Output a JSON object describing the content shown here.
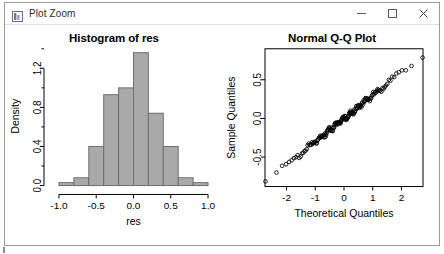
{
  "window": {
    "title": "Plot Zoom",
    "icon": "plot-window-icon",
    "controls": {
      "minimize_label": "Minimize",
      "maximize_label": "Maximize",
      "close_label": "Close"
    }
  },
  "chart_data": [
    {
      "type": "bar",
      "subtype": "histogram",
      "title": "Histogram of res",
      "xlabel": "res",
      "ylabel": "Density",
      "xlim": [
        -1.08,
        1.08
      ],
      "ylim": [
        0.0,
        1.42
      ],
      "xticks": [
        "-1.0",
        "-0.5",
        "0.0",
        "0.5",
        "1.0"
      ],
      "xtick_values": [
        -1.0,
        -0.5,
        0.0,
        0.5,
        1.0
      ],
      "yticks": [
        "0.0",
        "0.4",
        "0.8",
        "1.2"
      ],
      "ytick_values": [
        0.0,
        0.4,
        0.8,
        1.2
      ],
      "grid": false,
      "legend": null,
      "bin_width": 0.2,
      "bin_edges": [
        -1.0,
        -0.8,
        -0.6,
        -0.4,
        -0.2,
        0.0,
        0.2,
        0.4,
        0.6,
        0.8,
        1.0
      ],
      "categories": [
        "-1.0 to -0.8",
        "-0.8 to -0.6",
        "-0.6 to -0.4",
        "-0.4 to -0.2",
        "-0.2 to 0.0",
        "0.0 to 0.2",
        "0.2 to 0.4",
        "0.4 to 0.6",
        "0.6 to 0.8",
        "0.8 to 1.0"
      ],
      "values": [
        0.03,
        0.08,
        0.4,
        0.93,
        1.0,
        1.36,
        0.74,
        0.4,
        0.08,
        0.03
      ],
      "bar_fill": "#a9a9a9",
      "bar_stroke": "#6e6e6e"
    },
    {
      "type": "scatter",
      "subtype": "qq-plot",
      "title": "Normal Q-Q Plot",
      "xlabel": "Theoretical Quantiles",
      "ylabel": "Sample Quantiles",
      "xlim": [
        -2.75,
        2.75
      ],
      "ylim": [
        -0.88,
        0.9
      ],
      "xticks": [
        "-2",
        "-1",
        "0",
        "1",
        "2"
      ],
      "xtick_values": [
        -2,
        -1,
        0,
        1,
        2
      ],
      "yticks": [
        "-0.5",
        "0.0",
        "0.5"
      ],
      "ytick_values": [
        -0.5,
        0.0,
        0.5
      ],
      "grid": false,
      "legend": null,
      "n_points": 160,
      "point_marker": "open-circle",
      "point_color": "#000000",
      "box_border": true
    }
  ]
}
